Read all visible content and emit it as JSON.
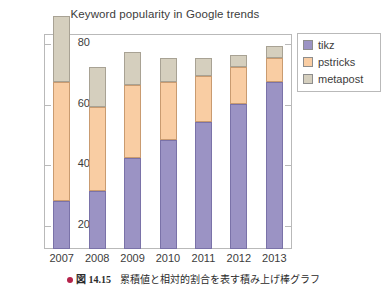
{
  "chart_data": {
    "type": "bar",
    "subtype": "stacked",
    "title": "Keyword popularity in Google trends",
    "xlabel": "",
    "ylabel": "",
    "categories": [
      "2007",
      "2008",
      "2009",
      "2010",
      "2011",
      "2012",
      "2013"
    ],
    "series": [
      {
        "name": "tikz",
        "color": "#9b93c4",
        "values": [
          16,
          19,
          30,
          36,
          42,
          48,
          55
        ]
      },
      {
        "name": "pstricks",
        "color": "#f9cda3",
        "values": [
          39,
          28,
          24,
          19,
          15,
          12,
          8
        ]
      },
      {
        "name": "metapost",
        "color": "#d5cfbe",
        "values": [
          22,
          13,
          11,
          8,
          6,
          4,
          4
        ]
      }
    ],
    "cumulative_totals": [
      77,
      60,
      65,
      63,
      63,
      64,
      67
    ],
    "yticks": [
      20,
      40,
      60,
      80
    ],
    "ytick_labels": [
      "20",
      "40",
      "60",
      "80"
    ],
    "ylim": [
      12,
      83
    ],
    "grid": false,
    "legend_position": "outside-top-right",
    "frame": true
  },
  "legend": {
    "items": [
      {
        "label": "tikz",
        "color": "#9b93c4"
      },
      {
        "label": "pstricks",
        "color": "#f9cda3"
      },
      {
        "label": "metapost",
        "color": "#d5cfbe"
      }
    ]
  },
  "caption": {
    "bullet_color": "#b5234a",
    "label": "図",
    "number": "14.15",
    "text": "累積値と相対的割合を表す積み上げ棒グラフ"
  }
}
